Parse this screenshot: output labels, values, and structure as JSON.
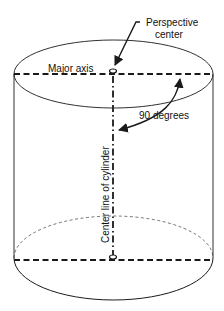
{
  "diagram": {
    "labels": {
      "perspective_center_line1": "Perspective",
      "perspective_center_line2": "center",
      "major_axis": "Major axis",
      "angle": "90 degrees",
      "center_line": "Center line of cylinder"
    },
    "colors": {
      "stroke": "#1a1a1a",
      "background": "#ffffff"
    }
  }
}
